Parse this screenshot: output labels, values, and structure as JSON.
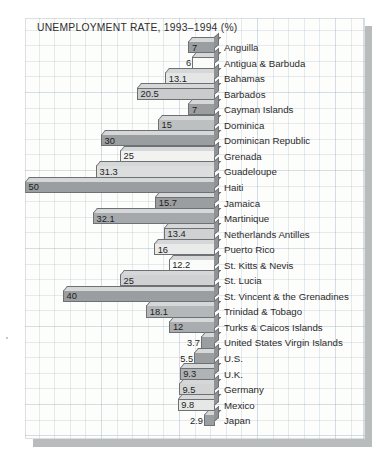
{
  "chart": {
    "title": "UNEMPLOYMENT RATE, 1993–1994 (%)"
  },
  "chart_data": {
    "type": "bar",
    "orientation": "horizontal",
    "title": "UNEMPLOYMENT RATE, 1993–1994 (%)",
    "xlabel": "",
    "ylabel": "",
    "unit": "%",
    "period": "1993–1994",
    "xlim": [
      0,
      50
    ],
    "grid": true,
    "legend": "none",
    "bars_anchored": "right",
    "categories": [
      "Anguilla",
      "Antigua & Barbuda",
      "Bahamas",
      "Barbados",
      "Cayman Islands",
      "Dominica",
      "Dominican Republic",
      "Grenada",
      "Guadeloupe",
      "Haiti",
      "Jamaica",
      "Martinique",
      "Netherlands Antilles",
      "Puerto Rico",
      "St. Kitts & Nevis",
      "St. Lucia",
      "St. Vincent & the Grenadines",
      "Trinidad & Tobago",
      "Turks & Caicos Islands",
      "United States Virgin Islands",
      "U.S.",
      "U.K.",
      "Germany",
      "Mexico",
      "Japan"
    ],
    "values": [
      7,
      6,
      13.1,
      20.5,
      7,
      15,
      30,
      25,
      31.3,
      50,
      15.7,
      32.1,
      13.4,
      16,
      12.2,
      25,
      40,
      18.1,
      12,
      3.7,
      5.5,
      9.3,
      9.5,
      9.8,
      2.9
    ],
    "value_labels": [
      "7",
      "6",
      "13.1",
      "20.5",
      "7",
      "15",
      "30",
      "25",
      "31.3",
      "50",
      "15.7",
      "32.1",
      "13.4",
      "16",
      "12.2",
      "25",
      "40",
      "18.1",
      "12",
      "3.7",
      "5.5",
      "9.3",
      "9.5",
      "9.8",
      "2.9"
    ],
    "bar_colors": [
      "#9a9ea0",
      "#fbfbfa",
      "#e4e5e5",
      "#c9cbcc",
      "#9a9ea0",
      "#bdc0c1",
      "#9a9ea0",
      "#f2f2f1",
      "#dcdddd",
      "#9a9ea0",
      "#9a9ea0",
      "#a5a9ab",
      "#cfd1d2",
      "#e9eaea",
      "#fbfbfa",
      "#cfd1d2",
      "#9a9ea0",
      "#b4b7b9",
      "#a9adaf",
      "#9a9ea0",
      "#9a9ea0",
      "#b0b3b5",
      "#d2d4d4",
      "#e6e7e7",
      "#9a9ea0"
    ]
  }
}
